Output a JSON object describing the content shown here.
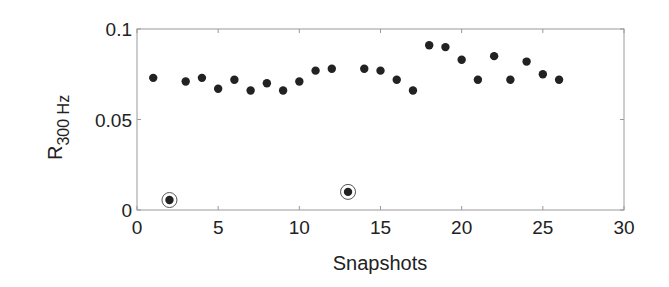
{
  "chart_data": {
    "type": "scatter",
    "title": "",
    "xlabel": "Snapshots",
    "ylabel": "R",
    "ylabel_subscript": "300 Hz",
    "xlim": [
      0,
      30
    ],
    "ylim": [
      0,
      0.1
    ],
    "xticks": [
      0,
      5,
      10,
      15,
      20,
      25,
      30
    ],
    "xtick_labels": [
      "0",
      "5",
      "10",
      "15",
      "20",
      "25",
      "30"
    ],
    "yticks": [
      0,
      0.05,
      0.1
    ],
    "ytick_labels": [
      "0",
      "0.05",
      "0.1"
    ],
    "grid": false,
    "legend": null,
    "series": [
      {
        "name": "R_300Hz",
        "marker": "filled-circle",
        "color": "#222222",
        "x": [
          1,
          2,
          3,
          4,
          5,
          6,
          7,
          8,
          9,
          10,
          11,
          12,
          13,
          14,
          15,
          16,
          17,
          18,
          19,
          20,
          21,
          22,
          23,
          24,
          25,
          26
        ],
        "y": [
          0.073,
          0.0055,
          0.071,
          0.073,
          0.067,
          0.072,
          0.066,
          0.07,
          0.066,
          0.071,
          0.077,
          0.078,
          0.01,
          0.078,
          0.077,
          0.072,
          0.066,
          0.091,
          0.09,
          0.083,
          0.072,
          0.085,
          0.072,
          0.082,
          0.075,
          0.072
        ]
      }
    ],
    "annotations": [
      {
        "type": "circled-outlier",
        "x": 2,
        "y": 0.0055
      },
      {
        "type": "circled-outlier",
        "x": 13,
        "y": 0.01
      }
    ]
  }
}
